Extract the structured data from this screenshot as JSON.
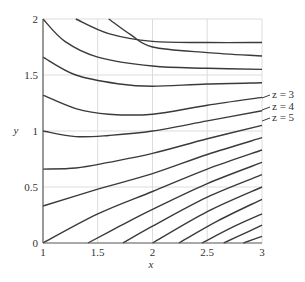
{
  "chart_data": {
    "type": "line",
    "title": "",
    "xlabel": "x",
    "ylabel": "y",
    "xlim": [
      1,
      3
    ],
    "ylim": [
      0,
      2
    ],
    "grid": true,
    "x_ticks": [
      "1",
      "1.5",
      "2",
      "2.5",
      "3"
    ],
    "y_ticks": [
      "0",
      "0.5",
      "1",
      "1.5",
      "2"
    ],
    "annotations": [
      "z = 3",
      "z = 4",
      "z = 5"
    ],
    "series": [
      {
        "name": "contour-1",
        "points": [
          [
            1.3,
            2.0
          ],
          [
            1.6,
            1.87
          ],
          [
            2.0,
            1.8
          ],
          [
            2.5,
            1.79
          ],
          [
            3.0,
            1.79
          ]
        ]
      },
      {
        "name": "contour-2",
        "points": [
          [
            1.6,
            2.0
          ],
          [
            1.8,
            1.86
          ],
          [
            2.0,
            1.75
          ],
          [
            2.5,
            1.7
          ],
          [
            3.0,
            1.67
          ]
        ]
      },
      {
        "name": "contour-3",
        "points": [
          [
            1.0,
            2.0
          ],
          [
            1.2,
            1.8
          ],
          [
            1.5,
            1.66
          ],
          [
            2.0,
            1.58
          ],
          [
            2.5,
            1.56
          ],
          [
            3.0,
            1.55
          ]
        ]
      },
      {
        "name": "contour-4",
        "points": [
          [
            1.0,
            1.66
          ],
          [
            1.3,
            1.5
          ],
          [
            1.7,
            1.42
          ],
          [
            2.0,
            1.4
          ],
          [
            2.5,
            1.42
          ],
          [
            3.0,
            1.43
          ]
        ]
      },
      {
        "name": "contour-5",
        "points": [
          [
            1.0,
            1.32
          ],
          [
            1.3,
            1.2
          ],
          [
            1.6,
            1.15
          ],
          [
            2.0,
            1.15
          ],
          [
            2.5,
            1.23
          ],
          [
            3.0,
            1.3
          ]
        ]
      },
      {
        "name": "contour-6",
        "points": [
          [
            1.0,
            1.0
          ],
          [
            1.3,
            0.95
          ],
          [
            1.6,
            0.96
          ],
          [
            2.0,
            1.0
          ],
          [
            2.5,
            1.09
          ],
          [
            3.0,
            1.18
          ]
        ]
      },
      {
        "name": "contour-7",
        "points": [
          [
            1.0,
            0.66
          ],
          [
            1.3,
            0.67
          ],
          [
            1.6,
            0.72
          ],
          [
            2.0,
            0.8
          ],
          [
            2.5,
            0.93
          ],
          [
            3.0,
            1.05
          ]
        ]
      },
      {
        "name": "contour-8",
        "points": [
          [
            1.0,
            0.33
          ],
          [
            1.5,
            0.48
          ],
          [
            2.0,
            0.62
          ],
          [
            2.5,
            0.79
          ],
          [
            3.0,
            0.94
          ]
        ]
      },
      {
        "name": "contour-9",
        "points": [
          [
            1.0,
            0.0
          ],
          [
            1.5,
            0.26
          ],
          [
            2.0,
            0.46
          ],
          [
            2.5,
            0.66
          ],
          [
            3.0,
            0.83
          ]
        ]
      },
      {
        "name": "contour-10",
        "points": [
          [
            1.41,
            0.0
          ],
          [
            1.7,
            0.15
          ],
          [
            2.0,
            0.3
          ],
          [
            2.5,
            0.53
          ],
          [
            3.0,
            0.72
          ]
        ]
      },
      {
        "name": "contour-11",
        "points": [
          [
            1.73,
            0.0
          ],
          [
            2.0,
            0.15
          ],
          [
            2.5,
            0.41
          ],
          [
            3.0,
            0.61
          ]
        ]
      },
      {
        "name": "contour-12",
        "points": [
          [
            2.0,
            0.0
          ],
          [
            2.5,
            0.28
          ],
          [
            3.0,
            0.5
          ]
        ]
      },
      {
        "name": "contour-13",
        "points": [
          [
            2.24,
            0.0
          ],
          [
            2.6,
            0.2
          ],
          [
            3.0,
            0.39
          ]
        ]
      },
      {
        "name": "contour-14",
        "points": [
          [
            2.45,
            0.0
          ],
          [
            2.75,
            0.15
          ],
          [
            3.0,
            0.26
          ]
        ]
      },
      {
        "name": "contour-15",
        "points": [
          [
            2.65,
            0.0
          ],
          [
            2.85,
            0.09
          ],
          [
            3.0,
            0.16
          ]
        ]
      },
      {
        "name": "contour-16",
        "points": [
          [
            2.83,
            0.0
          ],
          [
            3.0,
            0.06
          ]
        ]
      }
    ]
  },
  "labels": {
    "x_axis": "x",
    "y_axis": "y",
    "x_ticks": [
      "1",
      "1.5",
      "2",
      "2.5",
      "3"
    ],
    "y_ticks": [
      "0",
      "0.5",
      "1",
      "1.5",
      "2"
    ],
    "z3": "z = 3",
    "z4": "z = 4",
    "z5": "z = 5"
  }
}
